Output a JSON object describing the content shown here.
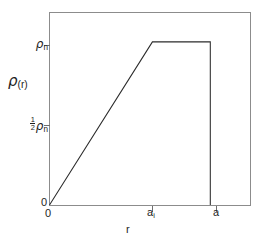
{
  "figure": {
    "background_color": "#ffffff",
    "frame_color": "#8c8c8c",
    "curve_color": "#2b2b2b"
  },
  "axes": {
    "y_axis_title": "ρ(r)",
    "x_axis_title": "r",
    "y_tick_labels": {
      "zero": "0",
      "half": "½ρₙ",
      "top": "ρₙ"
    },
    "x_tick_labels": {
      "zero": "0",
      "inner_radius": "aᵢ",
      "outer_radius": "a"
    },
    "symbols": {
      "rho": "ρ",
      "subscript_n": "n",
      "subscript_r": "(r)",
      "subscript_i": "i",
      "letter_a": "a",
      "fraction_numerator": "1",
      "fraction_denominator": "2"
    }
  },
  "chart_data": {
    "type": "line",
    "title": "",
    "xlabel": "r",
    "ylabel": "ρ(r)",
    "xlim": [
      0,
      1.25
    ],
    "ylim": [
      0,
      1.18
    ],
    "grid": false,
    "legend": null,
    "x_ticks": [
      {
        "value": 0,
        "label": "0"
      },
      {
        "value": 0.64,
        "label": "aᵢ"
      },
      {
        "value": 1.0,
        "label": "a"
      }
    ],
    "y_ticks": [
      {
        "value": 0,
        "label": "0"
      },
      {
        "value": 0.5,
        "label": "½ρₙ"
      },
      {
        "value": 1.0,
        "label": "ρₙ"
      }
    ],
    "series": [
      {
        "name": "density profile",
        "x": [
          0,
          0.64,
          1.0,
          1.0
        ],
        "values": [
          0,
          1.0,
          1.0,
          0
        ]
      }
    ]
  }
}
